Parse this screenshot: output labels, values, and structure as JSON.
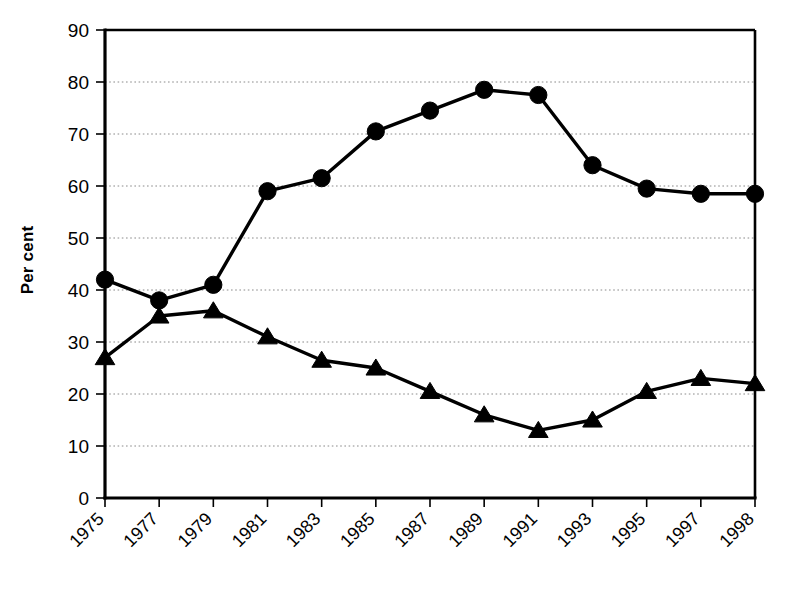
{
  "chart_data": {
    "type": "line",
    "title": "",
    "xlabel": "",
    "ylabel": "Per cent",
    "ylim": [
      0,
      90
    ],
    "ytick_step": 10,
    "yticks": [
      0,
      10,
      20,
      30,
      40,
      50,
      60,
      70,
      80,
      90
    ],
    "grid": true,
    "grid_axis": "y",
    "legend": "none",
    "categories": [
      "1975",
      "1977",
      "1979",
      "1981",
      "1983",
      "1985",
      "1987",
      "1989",
      "1991",
      "1993",
      "1995",
      "1997",
      "1998"
    ],
    "xtick_labels": [
      "1975",
      "1977",
      "1979",
      "1981",
      "1983",
      "1985",
      "1987",
      "1989",
      "1991",
      "1993",
      "1995",
      "1997",
      "1998"
    ],
    "xtick_label_rotation": 45,
    "series": [
      {
        "name": "series-circle",
        "marker": "circle",
        "color": "#000000",
        "values": [
          42,
          38,
          41,
          59,
          61.5,
          70.5,
          74.5,
          78.5,
          77.5,
          64,
          59.5,
          58.5,
          58.5
        ]
      },
      {
        "name": "series-triangle",
        "marker": "triangle",
        "color": "#000000",
        "values": [
          27,
          35,
          36,
          31,
          26.5,
          25,
          20.5,
          16,
          13,
          15,
          20.5,
          23,
          22
        ]
      }
    ]
  },
  "axes": {
    "y_title": "Per cent"
  },
  "colors": {
    "ink": "#000000",
    "grid": "#8a8a8a",
    "background": "#ffffff"
  }
}
